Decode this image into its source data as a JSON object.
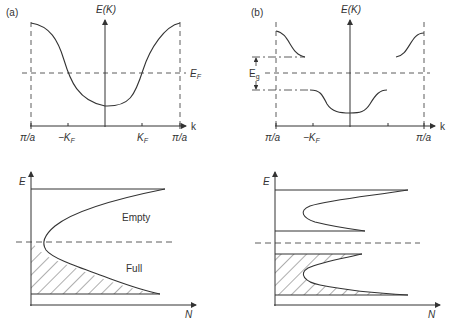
{
  "panels": {
    "a": {
      "label": "(a)",
      "y_axis": "E(K)",
      "x_axis": "k",
      "fermi": "E",
      "fermi_sub": "F",
      "ticks": [
        "π/a",
        "−K",
        "K",
        "π/a"
      ],
      "tick_sub": "F"
    },
    "b": {
      "label": "(b)",
      "y_axis": "E(K)",
      "x_axis": "k",
      "gap": "E",
      "gap_sub": "g",
      "ticks": [
        "π/a",
        "−K",
        "π/a"
      ],
      "tick_sub": "F"
    },
    "c": {
      "y_axis": "E",
      "x_axis": "N",
      "empty": "Empty",
      "full": "Full"
    },
    "d": {
      "y_axis": "E",
      "x_axis": "N"
    }
  },
  "colors": {
    "line": "#333333",
    "background": "#ffffff"
  }
}
